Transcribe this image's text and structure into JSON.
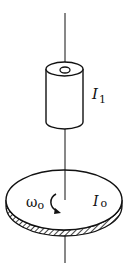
{
  "diagram": {
    "type": "rotational-mechanics",
    "labels": {
      "cylinder_symbol": "I",
      "cylinder_subscript": "1",
      "disk_symbol": "I",
      "disk_subscript": "o",
      "omega_symbol": "ω",
      "omega_subscript": "o"
    },
    "colors": {
      "stroke": "#111111",
      "background": "#ffffff"
    }
  }
}
